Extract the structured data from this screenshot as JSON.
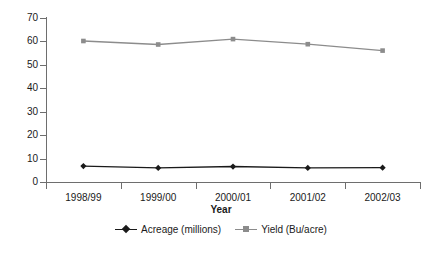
{
  "chart_data": {
    "type": "line",
    "title": "",
    "subtitle": "",
    "xlabel": "Year",
    "ylabel": "",
    "categories": [
      "1998/99",
      "1999/00",
      "2000/01",
      "2001/02",
      "2002/03"
    ],
    "series": [
      {
        "name": "Acreage (millions)",
        "values": [
          6.8,
          6.0,
          6.6,
          6.0,
          6.1
        ],
        "color": "#1a1a1a",
        "marker": "diamond"
      },
      {
        "name": "Yield (Bu/acre)",
        "values": [
          60.2,
          58.7,
          61.0,
          58.8,
          56.1
        ],
        "color": "#8c8c8c",
        "marker": "square"
      }
    ],
    "ylim": [
      0,
      70
    ],
    "yticks": [
      0,
      10,
      20,
      30,
      40,
      50,
      60,
      70
    ],
    "ytick_labels": [
      "0",
      "10",
      "20",
      "30",
      "40",
      "50",
      "60",
      "70"
    ],
    "grid": false,
    "legend_position": "bottom",
    "annotations": []
  },
  "colors": {
    "axis": "#6e6e6e",
    "text": "#1a1a1a",
    "acreage": "#1a1a1a",
    "yield": "#8c8c8c",
    "background": "#ffffff"
  }
}
